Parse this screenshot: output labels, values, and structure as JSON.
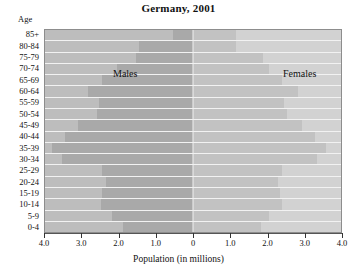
{
  "chart_data": {
    "type": "bar",
    "subtype": "population-pyramid",
    "title": "Germany, 2001",
    "xlabel": "Population (in millions)",
    "ylabel": "Age",
    "xlim": [
      -4.0,
      4.0
    ],
    "xtick_labels": [
      "4.0",
      "3.0",
      "2.0",
      "1.0",
      "0",
      "1.0",
      "2.0",
      "3.0",
      "4.0"
    ],
    "xtick_values": [
      -4.0,
      -3.0,
      -2.0,
      -1.0,
      0,
      1.0,
      2.0,
      3.0,
      4.0
    ],
    "grid": false,
    "legend": "inline-labels",
    "categories": [
      "85+",
      "80-84",
      "75-79",
      "70-74",
      "65-69",
      "60-64",
      "55-59",
      "50-54",
      "45-49",
      "40-44",
      "35-39",
      "30-34",
      "25-29",
      "20-24",
      "15-19",
      "10-14",
      "5-9",
      "0-4"
    ],
    "series": [
      {
        "name": "Males",
        "color": "#a9a9a9",
        "values": [
          0.55,
          1.45,
          1.55,
          2.05,
          2.45,
          2.85,
          2.55,
          2.6,
          3.1,
          3.45,
          3.8,
          3.55,
          2.45,
          2.35,
          2.45,
          2.5,
          2.2,
          1.9
        ]
      },
      {
        "name": "Females",
        "color": "#c2c2c2",
        "values": [
          1.15,
          1.15,
          1.9,
          2.05,
          2.4,
          2.85,
          2.45,
          2.55,
          2.95,
          3.3,
          3.6,
          3.35,
          2.4,
          2.3,
          2.35,
          2.4,
          2.05,
          1.85
        ]
      }
    ]
  },
  "axis": {
    "age_caption": "Age"
  },
  "labels": {
    "males": "Males",
    "females": "Females"
  }
}
